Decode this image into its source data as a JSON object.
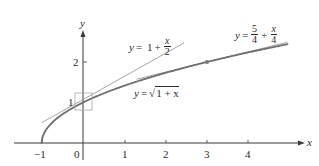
{
  "figure": {
    "title": "",
    "axes": {
      "x_label": "x",
      "y_label": "y",
      "x_ticks": [
        {
          "value": -1,
          "label": "−1"
        },
        {
          "value": 0,
          "label": "0"
        },
        {
          "value": 1,
          "label": "1"
        },
        {
          "value": 2,
          "label": "2"
        },
        {
          "value": 3,
          "label": "3"
        },
        {
          "value": 4,
          "label": "4"
        }
      ],
      "y_ticks": [
        {
          "value": 1,
          "label": "1"
        },
        {
          "value": 2,
          "label": "2"
        }
      ]
    },
    "labels": {
      "tangent_at_0": {
        "lhs": "y",
        "eq": "=",
        "const": "1",
        "plus": "+",
        "num": "x",
        "den": "2"
      },
      "curve": {
        "lhs": "y",
        "eq": "=",
        "radical": "√",
        "inside": "1 + x"
      },
      "tangent_at_3": {
        "lhs": "y",
        "eq": "=",
        "num1": "5",
        "den1": "4",
        "plus": "+",
        "num2": "x",
        "den2": "4"
      }
    },
    "colors": {
      "axis": "#3a3a3a",
      "curve": "#6e6e6e",
      "tangent": "#9a9a9a",
      "box": "#a8a8a8",
      "point": "#777777",
      "text": "#2a2a2a"
    }
  },
  "chart_data": {
    "type": "line",
    "title": "",
    "xlabel": "x",
    "ylabel": "y",
    "xlim": [
      -1.2,
      5.3
    ],
    "ylim": [
      0,
      2.7
    ],
    "grid": false,
    "series": [
      {
        "name": "y = √(1 + x)",
        "function": "sqrt(1+x)",
        "x_range": [
          -1,
          4.95
        ],
        "style": "thick"
      },
      {
        "name": "y = 1 + x/2",
        "function": "1 + x/2",
        "x_range": [
          -1,
          2.45
        ],
        "style": "thin"
      },
      {
        "name": "y = 5/4 + x/4",
        "function": "5/4 + x/4",
        "x_range": [
          1.3,
          4.95
        ],
        "style": "thin"
      }
    ],
    "points": [
      {
        "x": 3,
        "y": 2,
        "label": "point of tangency"
      },
      {
        "x": 0,
        "y": 1,
        "label": "boxed point of tangency"
      }
    ],
    "annotations": [
      "y = 1 + x/2",
      "y = √(1 + x)",
      "y = 5/4 + x/4"
    ]
  }
}
